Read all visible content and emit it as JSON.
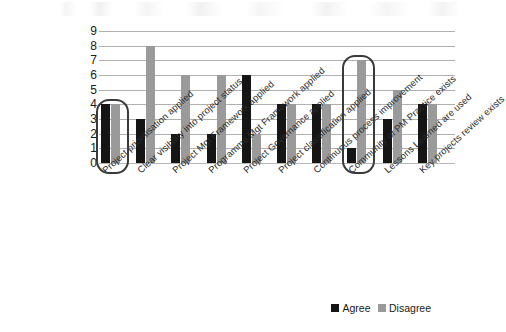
{
  "chart_data": {
    "type": "bar",
    "title": "",
    "subtitle": "",
    "xlabel": "",
    "ylabel": "",
    "ylim": [
      0,
      9
    ],
    "yticks": [
      0,
      1,
      2,
      3,
      4,
      5,
      6,
      7,
      8,
      9
    ],
    "grid": true,
    "legend_position": "bottom-right",
    "categories": [
      "Project prioritisation applied",
      "Clear visibility into project status",
      "Project Mgt Framework applied",
      "Programme Mgt Framework applied",
      "Project Governance applied",
      "Project classification applied",
      "Continuous process improvement",
      "Community of PM Practice exists",
      "Lessons Learned are used",
      "Key projects review exists"
    ],
    "series": [
      {
        "name": "Agree",
        "color": "#151515",
        "values": [
          4,
          3,
          2,
          2,
          6,
          4,
          4,
          1,
          3,
          4
        ]
      },
      {
        "name": "Disagree",
        "color": "#9a9a9a",
        "values": [
          4,
          8,
          6,
          6,
          2,
          4,
          4,
          7,
          5,
          4
        ]
      }
    ],
    "annotations": [
      {
        "type": "highlight-box",
        "category": "Project prioritisation applied",
        "shape": "rounded-rectangle",
        "color": "#3a3a3a"
      },
      {
        "type": "highlight-box",
        "category": "Community of PM Practice exists",
        "shape": "rounded-rectangle",
        "color": "#3a3a3a"
      }
    ]
  },
  "legend": {
    "items": [
      {
        "label": "Agree",
        "color": "#151515"
      },
      {
        "label": "Disagree",
        "color": "#9a9a9a"
      }
    ]
  }
}
